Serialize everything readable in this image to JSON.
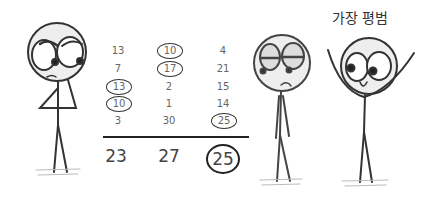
{
  "caption": "가장 평범",
  "columns": [
    {
      "values": [
        "13",
        "7",
        "13",
        "10",
        "3"
      ],
      "circled": [
        false,
        false,
        true,
        true,
        false
      ],
      "total": "23",
      "total_circled": false
    },
    {
      "values": [
        "10",
        "17",
        "2",
        "1",
        "30"
      ],
      "circled": [
        true,
        true,
        false,
        false,
        false
      ],
      "total": "27",
      "total_circled": false
    },
    {
      "values": [
        "4",
        "21",
        "15",
        "14",
        "25"
      ],
      "circled": [
        false,
        false,
        false,
        false,
        true
      ],
      "total": "25",
      "total_circled": true
    }
  ],
  "figures": [
    {
      "name": "thinking-figure",
      "expression": "skeptical, hand on chin"
    },
    {
      "name": "unimpressed-figure",
      "expression": "bored, frowning"
    },
    {
      "name": "happy-figure",
      "expression": "smiling, arms raised"
    }
  ]
}
